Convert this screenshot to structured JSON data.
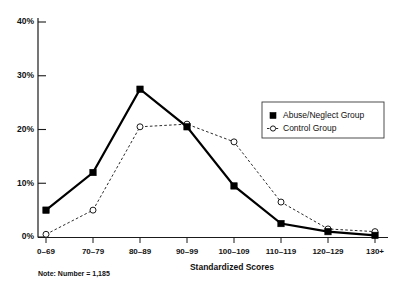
{
  "chart_data": {
    "type": "line",
    "title": "",
    "xlabel": "Standardized Scores",
    "ylabel": "",
    "categories": [
      "0–69",
      "70–79",
      "80–89",
      "90–99",
      "100–109",
      "110–119",
      "120–129",
      "130+"
    ],
    "series": [
      {
        "name": "Abuse/Neglect Group",
        "marker": "filled-square",
        "line_style": "solid",
        "values": [
          5.0,
          12.0,
          27.5,
          20.5,
          9.5,
          2.5,
          1.0,
          0.3
        ]
      },
      {
        "name": "Control Group",
        "marker": "open-circle",
        "line_style": "dashed",
        "values": [
          0.5,
          5.0,
          20.5,
          21.0,
          17.7,
          6.5,
          1.5,
          1.0
        ]
      }
    ],
    "ylim": [
      0,
      40
    ],
    "yticks": [
      0,
      10,
      20,
      30,
      40
    ],
    "ytick_labels": [
      "0%",
      "10%",
      "20%",
      "30%",
      "40%"
    ],
    "grid": false,
    "legend_position": "right-upper"
  },
  "legend": {
    "entries": [
      {
        "label": "Abuse/Neglect Group",
        "marker": "filled-square"
      },
      {
        "label": "Control Group",
        "marker": "open-circle"
      }
    ]
  },
  "note": {
    "text": "Note: Number = 1,185"
  },
  "colors": {
    "abuse_series": "#000000",
    "control_series": "#2b2b2b",
    "axis": "#1a1a1a",
    "background": "#ffffff"
  }
}
